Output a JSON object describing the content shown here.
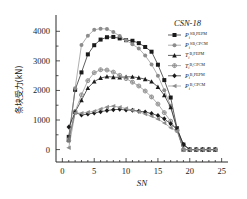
{
  "chart_data": {
    "type": "line",
    "title": "CSN-18",
    "xlabel": "SN",
    "ylabel": "条块受力(kN)",
    "xlim": [
      -1,
      26
    ],
    "ylim": [
      -420,
      4450
    ],
    "xticks": [
      0,
      5,
      10,
      15,
      20,
      25
    ],
    "yticks": [
      0,
      1000,
      2000,
      3000,
      4000
    ],
    "grid": false,
    "legend_position": "upper-right",
    "x": [
      1,
      2,
      3,
      4,
      5,
      6,
      7,
      8,
      9,
      10,
      11,
      12,
      13,
      14,
      15,
      16,
      17,
      18,
      19,
      20,
      21,
      22,
      23,
      24
    ],
    "series": [
      {
        "name": "P_i^{SB,PEPM}",
        "label_base": "P",
        "label_sub": "i",
        "label_sup": "SB,PEPM",
        "marker": "filled-square",
        "color": "#1a1a1a",
        "values": [
          430,
          2020,
          2610,
          3220,
          3530,
          3720,
          3800,
          3810,
          3760,
          3700,
          3680,
          3600,
          3470,
          3310,
          2870,
          2350,
          1760,
          720,
          170,
          0,
          0,
          0,
          0,
          0
        ]
      },
      {
        "name": "P_i^{SB,CPCM}",
        "label_base": "P",
        "label_sub": "i",
        "label_sup": "SB,CPCM",
        "marker": "filled-circle",
        "color": "#8c8c8c",
        "values": [
          350,
          2070,
          3540,
          3850,
          4050,
          4090,
          4080,
          3980,
          3840,
          3700,
          3560,
          3420,
          3180,
          2880,
          2500,
          2010,
          1480,
          700,
          0,
          0,
          0,
          0,
          0,
          0
        ]
      },
      {
        "name": "T_i^{B,PEPM}",
        "label_base": "T",
        "label_sub": "i",
        "label_sup": "B,PEPM",
        "marker": "filled-triangle",
        "color": "#1a1a1a",
        "values": [
          330,
          1270,
          1670,
          2080,
          2300,
          2420,
          2470,
          2450,
          2440,
          2460,
          2460,
          2430,
          2380,
          2300,
          2120,
          1840,
          1430,
          700,
          0,
          0,
          0,
          0,
          0,
          0
        ]
      },
      {
        "name": "T_i^{B,CPCM}",
        "label_base": "T",
        "label_sub": "i",
        "label_sup": "B,CPCM",
        "marker": "circle-cross",
        "color": "#8c8c8c",
        "values": [
          300,
          1290,
          1850,
          2330,
          2600,
          2700,
          2690,
          2620,
          2510,
          2400,
          2280,
          2150,
          1980,
          1780,
          1540,
          1250,
          960,
          640,
          0,
          0,
          0,
          0,
          0,
          0
        ]
      },
      {
        "name": "P_i^{B,PEPM}",
        "label_base": "P",
        "label_sub": "i",
        "label_sup": "B,PEPM",
        "marker": "filled-diamond",
        "color": "#1a1a1a",
        "values": [
          760,
          1260,
          1170,
          1200,
          1240,
          1280,
          1320,
          1350,
          1360,
          1340,
          1330,
          1300,
          1270,
          1220,
          1150,
          1040,
          870,
          690,
          170,
          0,
          0,
          0,
          0,
          0
        ]
      },
      {
        "name": "P_i^{B,CPCM}",
        "label_base": "P",
        "label_sub": "i",
        "label_sup": "B,CPCM",
        "marker": "left-triangle",
        "color": "#8c8c8c",
        "values": [
          60,
          1240,
          1230,
          1260,
          1300,
          1370,
          1440,
          1470,
          1430,
          1390,
          1330,
          1280,
          1200,
          1130,
          1030,
          900,
          740,
          640,
          0,
          0,
          0,
          0,
          0,
          0
        ]
      }
    ]
  }
}
